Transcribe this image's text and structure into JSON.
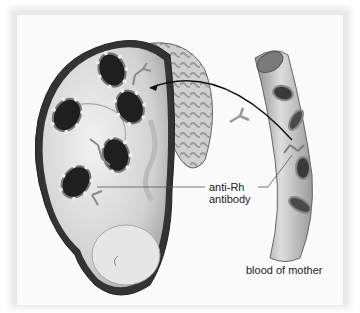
{
  "figure": {
    "labels": {
      "antibody_line1": "anti-Rh",
      "antibody_line2": "antibody",
      "vessel": "blood of mother"
    },
    "elements": {
      "fetus": "fetus in uterus",
      "placenta": "placenta",
      "blood_vessel": "maternal blood vessel",
      "fetal_rbc_count": 5,
      "maternal_rbc_count": 4,
      "antibody_glyph": "Y-shaped antibody"
    },
    "colors": {
      "background": "#fbfbfb",
      "outline": "#333333",
      "skin": "#d9d9d9",
      "rbc_dark": "#2a2a2a",
      "vessel": "#bdbdbd"
    }
  }
}
